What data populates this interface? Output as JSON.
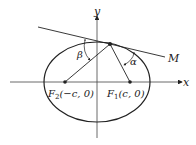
{
  "diagram": {
    "type": "ellipse-reflection-property",
    "axes": {
      "x_label": "x",
      "y_label": "y"
    },
    "foci": [
      {
        "name": "F2",
        "sub": "2",
        "coords": "(−c, 0)"
      },
      {
        "name": "F1",
        "sub": "1",
        "coords": "(c, 0)"
      }
    ],
    "tangent_label": "M",
    "angles": {
      "left": "β",
      "right": "α"
    },
    "colors": {
      "stroke": "#222222",
      "background": "#ffffff"
    }
  }
}
